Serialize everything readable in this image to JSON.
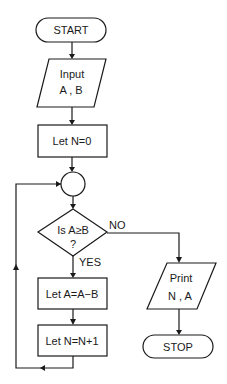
{
  "flowchart": {
    "start": {
      "label": "START"
    },
    "input": {
      "line1": "Input",
      "line2": "A , B"
    },
    "init": {
      "label": "Let N=0"
    },
    "connector": {
      "label": ""
    },
    "decision": {
      "line1": "Is A≥B",
      "line2": "?",
      "no_label": "NO",
      "yes_label": "YES"
    },
    "subtract": {
      "label": "Let A=A−B"
    },
    "increment": {
      "label": "Let N=N+1"
    },
    "output": {
      "line1": "Print",
      "line2": "N , A"
    },
    "stop": {
      "label": "STOP"
    }
  },
  "colors": {
    "stroke": "#1a1a1a",
    "background": "#ffffff"
  }
}
